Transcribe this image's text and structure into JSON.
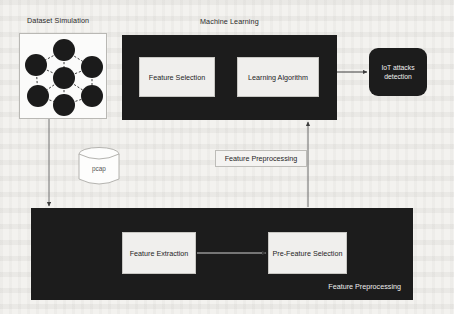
{
  "figure": {
    "background_color": "#f3f2ef",
    "dark_fill": "#1c1c1c",
    "panel_fill": "#f0efed",
    "line_color": "#4a4a4a"
  },
  "labels": {
    "dataset_simulation": "Dataset Simulation",
    "machine_learning": "Machine Learning",
    "pcap": "pcap",
    "feature_preprocessing_mid": "Feature Preprocessing",
    "feature_preprocessing_caption": "Feature Preprocessing"
  },
  "nodes": {
    "feature_selection": "Feature Selection",
    "learning_algorithm": "Learning Algorithm",
    "iot_attacks_detection": "IoT attacks\ndetection",
    "iot_attacks_detection_line1": "IoT attacks",
    "iot_attacks_detection_line2": "detection",
    "feature_extraction": "Feature Extraction",
    "pre_feature_selection": "Pre-Feature Selection"
  },
  "neural_network": {
    "node_count": 7,
    "node_color": "#1b1b1b",
    "edge_style": "dashed",
    "nodes": [
      {
        "id": "n-top",
        "cx": 44,
        "cy": 16,
        "r": 11
      },
      {
        "id": "n-left-mid",
        "cx": 16,
        "cy": 31,
        "r": 11
      },
      {
        "id": "n-right-mid",
        "cx": 72,
        "cy": 33,
        "r": 11
      },
      {
        "id": "n-center",
        "cx": 44,
        "cy": 44,
        "r": 11
      },
      {
        "id": "n-left-low",
        "cx": 18,
        "cy": 62,
        "r": 11
      },
      {
        "id": "n-bottom",
        "cx": 44,
        "cy": 71,
        "r": 11
      },
      {
        "id": "n-right-low",
        "cx": 72,
        "cy": 62,
        "r": 11
      }
    ],
    "edges": [
      [
        "n-top",
        "n-left-mid"
      ],
      [
        "n-top",
        "n-right-mid"
      ],
      [
        "n-top",
        "n-center"
      ],
      [
        "n-left-mid",
        "n-center"
      ],
      [
        "n-left-mid",
        "n-left-low"
      ],
      [
        "n-right-mid",
        "n-center"
      ],
      [
        "n-right-mid",
        "n-right-low"
      ],
      [
        "n-center",
        "n-bottom"
      ],
      [
        "n-center",
        "n-left-low"
      ],
      [
        "n-center",
        "n-right-low"
      ],
      [
        "n-left-low",
        "n-bottom"
      ],
      [
        "n-bottom",
        "n-right-low"
      ]
    ]
  },
  "connectors": [
    {
      "id": "dataset-to-preprocessing",
      "from": "dataset_simulation",
      "to": "feature_preprocessing_box",
      "direction": "down",
      "arrow": true
    },
    {
      "id": "preprocessing-to-ml",
      "from": "feature_preprocessing_box",
      "to": "machine_learning",
      "direction": "up",
      "arrow": true
    },
    {
      "id": "ml-to-iot",
      "from": "machine_learning",
      "to": "iot_attacks_detection",
      "direction": "right",
      "arrow": true
    },
    {
      "id": "extraction-to-pre-selection",
      "from": "feature_extraction",
      "to": "pre_feature_selection",
      "direction": "right",
      "arrow": true
    }
  ]
}
